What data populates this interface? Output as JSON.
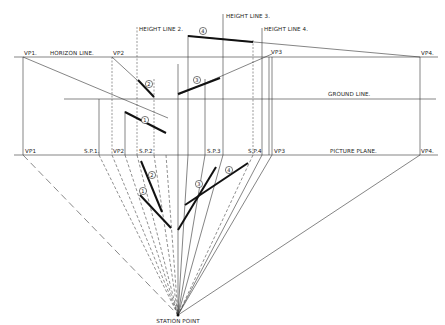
{
  "diagram": {
    "type": "two-point perspective construction (multiple vanishing points)",
    "lines": {
      "horizon_line": "HORIZON LINE.",
      "ground_line": "GROUND LINE.",
      "picture_plane": "PICTURE PLANE."
    },
    "height_lines": {
      "h2": "HEIGHT LINE 2.",
      "h3": "HEIGHT LINE 3.",
      "h4": "HEIGHT LINE 4."
    },
    "horizon_labels": {
      "vp1": "VP1.",
      "vp2": "VP2",
      "vp3": "VP3",
      "vp4": "VP4."
    },
    "picture_plane_labels": {
      "vp1": "VP1",
      "sp1": "S.P.1.",
      "vp2": "VP2",
      "sp2": "S.P.2",
      "sp3": "S.P.3",
      "sp4": "S.P.4",
      "vp3": "VP3",
      "vp4": "VP4."
    },
    "station_point": "STATION POINT",
    "element_numbers": [
      "1",
      "2",
      "3",
      "4"
    ]
  }
}
